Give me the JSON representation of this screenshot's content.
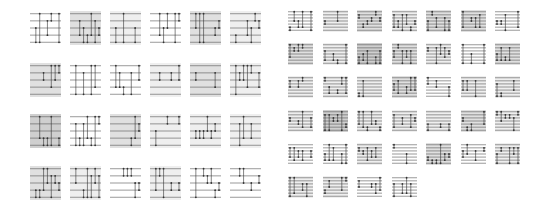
{
  "figure": {
    "shade_colors": [
      "#ffffff",
      "#efefef",
      "#e0e0e0",
      "#cfcfcf"
    ],
    "wire_color": "#555555",
    "gate_color": "#333333"
  },
  "left_grid": {
    "origin": [
      30,
      11
    ],
    "tile_size": [
      31,
      34
    ],
    "pitch": [
      40,
      51.5
    ],
    "wires": 5,
    "rows": [
      [
        0,
        2,
        1,
        0,
        2,
        1
      ],
      [
        2,
        0,
        0,
        1,
        2,
        1
      ],
      [
        3,
        0,
        2,
        1,
        1,
        1
      ],
      [
        2,
        1,
        0,
        1,
        0,
        0
      ]
    ]
  },
  "right_grid": {
    "origin": [
      288,
      10
    ],
    "tile_size": [
      25,
      22
    ],
    "pitch": [
      34.5,
      33.2
    ],
    "wires": 7,
    "rows": [
      [
        0,
        1,
        2,
        1,
        2,
        2,
        0
      ],
      [
        2,
        1,
        3,
        2,
        1,
        0,
        2
      ],
      [
        1,
        1,
        1,
        2,
        0,
        1,
        1
      ],
      [
        1,
        3,
        1,
        1,
        1,
        2,
        1
      ],
      [
        0,
        0,
        1,
        0,
        2,
        0,
        1
      ],
      [
        1,
        1,
        0,
        0
      ]
    ]
  }
}
